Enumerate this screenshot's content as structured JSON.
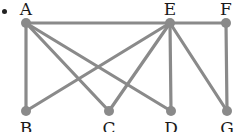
{
  "diagram": {
    "type": "graph",
    "bullet": true,
    "edge_color": "#8a8a8a",
    "node_color": "#8a8a8a",
    "nodes": [
      {
        "id": "A",
        "label": "A",
        "x": 26,
        "y": 23,
        "label_pos": "top"
      },
      {
        "id": "E",
        "label": "E",
        "x": 170,
        "y": 23,
        "label_pos": "top"
      },
      {
        "id": "F",
        "label": "F",
        "x": 226,
        "y": 23,
        "label_pos": "top"
      },
      {
        "id": "B",
        "label": "B",
        "x": 26,
        "y": 111,
        "label_pos": "bottom"
      },
      {
        "id": "C",
        "label": "C",
        "x": 109,
        "y": 111,
        "label_pos": "bottom"
      },
      {
        "id": "D",
        "label": "D",
        "x": 171,
        "y": 111,
        "label_pos": "bottom"
      },
      {
        "id": "G",
        "label": "G",
        "x": 227,
        "y": 111,
        "label_pos": "bottom"
      }
    ],
    "edges": [
      [
        "A",
        "E"
      ],
      [
        "E",
        "F"
      ],
      [
        "A",
        "B"
      ],
      [
        "A",
        "C"
      ],
      [
        "A",
        "D"
      ],
      [
        "E",
        "B"
      ],
      [
        "E",
        "C"
      ],
      [
        "E",
        "D"
      ],
      [
        "E",
        "G"
      ],
      [
        "F",
        "G"
      ]
    ]
  }
}
